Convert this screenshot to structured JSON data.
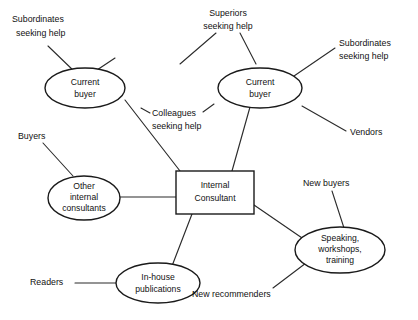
{
  "diagram": {
    "stroke_color": "#2b2b2b",
    "fill_color": "#ffffff",
    "nodes": [
      {
        "id": "current-buyer-left",
        "shape": "ellipse",
        "lines": [
          "Current",
          "buyer"
        ]
      },
      {
        "id": "current-buyer-right",
        "shape": "ellipse",
        "lines": [
          "Current",
          "buyer"
        ]
      },
      {
        "id": "other-internal-consultants",
        "shape": "ellipse",
        "lines": [
          "Other",
          "internal",
          "consultants"
        ]
      },
      {
        "id": "internal-consultant",
        "shape": "rectangle",
        "lines": [
          "Internal",
          "Consultant"
        ]
      },
      {
        "id": "in-house-publications",
        "shape": "ellipse",
        "lines": [
          "In-house",
          "publications"
        ]
      },
      {
        "id": "speaking-workshops-training",
        "shape": "ellipse",
        "lines": [
          "Speaking,",
          "workshops,",
          "training"
        ]
      }
    ],
    "labels": [
      {
        "id": "subordinates-seeking-help-left",
        "lines": [
          "Subordinates",
          "seeking help"
        ]
      },
      {
        "id": "superiors-seeking-help",
        "lines": [
          "Superiors",
          "seeking help"
        ]
      },
      {
        "id": "subordinates-seeking-help-right",
        "lines": [
          "Subordinates",
          "seeking help"
        ]
      },
      {
        "id": "colleagues-seeking-help",
        "lines": [
          "Colleagues",
          "seeking help"
        ]
      },
      {
        "id": "buyers",
        "lines": [
          "Buyers"
        ]
      },
      {
        "id": "vendors",
        "lines": [
          "Vendors"
        ]
      },
      {
        "id": "readers",
        "lines": [
          "Readers"
        ]
      },
      {
        "id": "new-buyers",
        "lines": [
          "New buyers"
        ]
      },
      {
        "id": "new-recommenders",
        "lines": [
          "New recommenders"
        ]
      }
    ],
    "text": {
      "current_buyer_l1": "Current",
      "current_buyer_l2": "buyer",
      "other_internal_l1": "Other",
      "other_internal_l2": "internal",
      "other_internal_l3": "consultants",
      "internal_consultant_l1": "Internal",
      "internal_consultant_l2": "Consultant",
      "in_house_l1": "In-house",
      "in_house_l2": "publications",
      "speaking_l1": "Speaking,",
      "speaking_l2": "workshops,",
      "speaking_l3": "training",
      "subordinates_l1": "Subordinates",
      "subordinates_l2": "seeking help",
      "superiors_l1": "Superiors",
      "superiors_l2": "seeking help",
      "colleagues_l1": "Colleagues",
      "colleagues_l2": "seeking help",
      "buyers": "Buyers",
      "vendors": "Vendors",
      "readers": "Readers",
      "new_buyers": "New buyers",
      "new_recommenders": "New recommenders"
    }
  }
}
